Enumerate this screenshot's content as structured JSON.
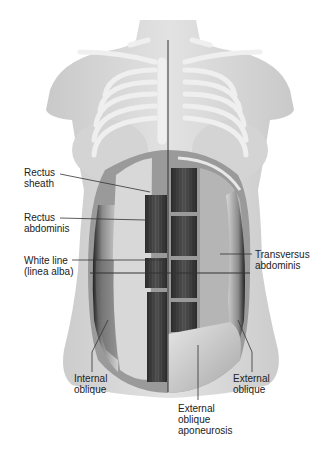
{
  "figure": {
    "labels": [
      {
        "id": "rectus-sheath",
        "line1": "Rectus",
        "line2": "sheath",
        "line3": ""
      },
      {
        "id": "rectus-abdominis",
        "line1": "Rectus",
        "line2": "abdominis",
        "line3": ""
      },
      {
        "id": "white-line",
        "line1": "White line",
        "line2": "(linea alba)",
        "line3": ""
      },
      {
        "id": "transversus-abdominis",
        "line1": "Transversus",
        "line2": "abdominis",
        "line3": ""
      },
      {
        "id": "internal-oblique",
        "line1": "Internal",
        "line2": "oblique",
        "line3": ""
      },
      {
        "id": "external-oblique",
        "line1": "External",
        "line2": "oblique",
        "line3": ""
      },
      {
        "id": "external-oblique-aponeurosis",
        "line1": "External",
        "line2": "oblique",
        "line3": "aponeurosis"
      }
    ]
  },
  "colors": {
    "background": "#ffffff",
    "skin": "#d9d9d9",
    "bone": "#ececec",
    "muscle_dark": "#3a3a3a",
    "muscle_mid": "#6e6e6e",
    "sheath": "#c8c8c8",
    "aponeurosis": "#bdbdbd",
    "text": "#222222",
    "leader": "#333333"
  }
}
